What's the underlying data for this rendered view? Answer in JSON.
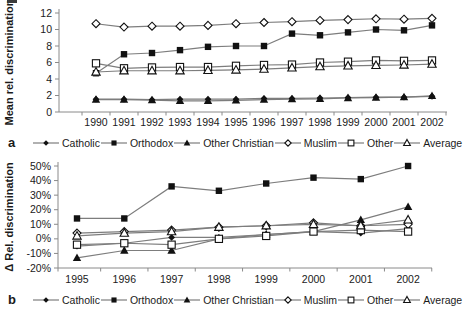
{
  "figure": {
    "background": "#ffffff",
    "line_color": "#7d7d7d",
    "marker_color": "#111111",
    "axis_color": "#8a8a8a",
    "text_color": "#1a1a1a",
    "panel_a_label": "a",
    "panel_b_label": "b"
  },
  "chart_data": [
    {
      "type": "line",
      "panel_label": "a",
      "title": "",
      "xlabel": "",
      "ylabel": "Mean rel. discrimination",
      "grid": false,
      "legend_position": "bottom",
      "ylim": [
        0,
        12
      ],
      "ytick_values": [
        0,
        2,
        4,
        6,
        8,
        10,
        12
      ],
      "ytick_labels": [
        "0",
        "2",
        "4",
        "6",
        "8",
        "10",
        "12"
      ],
      "categories": [
        "1990",
        "1991",
        "1992",
        "1993",
        "1994",
        "1995",
        "1996",
        "1997",
        "1998",
        "1999",
        "2000",
        "2001",
        "2002"
      ],
      "series": [
        {
          "name": "Catholic",
          "marker": "diamond-filled",
          "values": [
            1.55,
            1.55,
            1.5,
            1.55,
            1.55,
            1.55,
            1.65,
            1.65,
            1.7,
            1.75,
            1.8,
            1.8,
            1.9
          ]
        },
        {
          "name": "Orthodox",
          "marker": "square-filled",
          "values": [
            4.7,
            7.0,
            7.15,
            7.5,
            7.9,
            8.0,
            8.0,
            9.5,
            9.3,
            9.65,
            10.0,
            9.9,
            10.5
          ]
        },
        {
          "name": "Other Christian",
          "marker": "triangle-filled",
          "values": [
            1.5,
            1.5,
            1.45,
            1.35,
            1.35,
            1.4,
            1.5,
            1.55,
            1.6,
            1.7,
            1.75,
            1.8,
            1.95
          ]
        },
        {
          "name": "Muslim",
          "marker": "diamond-open",
          "values": [
            10.7,
            10.3,
            10.4,
            10.4,
            10.5,
            10.7,
            10.85,
            10.95,
            11.1,
            11.2,
            11.3,
            11.25,
            11.35
          ]
        },
        {
          "name": "Other",
          "marker": "square-open",
          "values": [
            5.9,
            5.3,
            5.4,
            5.45,
            5.45,
            5.6,
            5.7,
            5.75,
            6.0,
            6.1,
            6.25,
            6.2,
            6.25
          ]
        },
        {
          "name": "Average",
          "marker": "triangle-open",
          "values": [
            4.85,
            5.0,
            5.0,
            5.0,
            5.05,
            5.1,
            5.2,
            5.35,
            5.5,
            5.6,
            5.65,
            5.7,
            5.8
          ]
        }
      ]
    },
    {
      "type": "line",
      "panel_label": "b",
      "title": "",
      "xlabel": "",
      "ylabel": "Δ Rel. discrimination",
      "grid": false,
      "legend_position": "bottom",
      "ylim": [
        -20,
        50
      ],
      "ytick_values": [
        -20,
        -10,
        0,
        10,
        20,
        30,
        40,
        50
      ],
      "ytick_labels": [
        "-20%",
        "-10%",
        "0%",
        "10%",
        "20%",
        "30%",
        "40%",
        "50%"
      ],
      "categories": [
        "1995",
        "1996",
        "1997",
        "1998",
        "1999",
        "2000",
        "2001",
        "2002"
      ],
      "series": [
        {
          "name": "Catholic",
          "marker": "diamond-filled",
          "values": [
            -5,
            -3,
            1,
            1,
            3,
            5,
            4,
            7
          ]
        },
        {
          "name": "Orthodox",
          "marker": "square-filled",
          "values": [
            14,
            14,
            36,
            33,
            38,
            42,
            41,
            50
          ]
        },
        {
          "name": "Other Christian",
          "marker": "triangle-filled",
          "values": [
            -13,
            -8,
            -8,
            0,
            3,
            5,
            13,
            22
          ]
        },
        {
          "name": "Muslim",
          "marker": "diamond-open",
          "values": [
            4,
            5,
            6,
            8,
            9,
            11,
            9,
            10
          ]
        },
        {
          "name": "Other",
          "marker": "square-open",
          "values": [
            -4,
            -3,
            -4,
            0,
            2,
            5,
            6,
            5
          ]
        },
        {
          "name": "Average",
          "marker": "triangle-open",
          "values": [
            2,
            4,
            5,
            8,
            9,
            10,
            9,
            13
          ]
        }
      ]
    }
  ]
}
